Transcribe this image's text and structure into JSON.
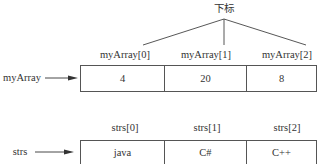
{
  "title": "下标",
  "myArray": {
    "name": "myArray",
    "indices": [
      "myArray[0]",
      "myArray[1]",
      "myArray[2]"
    ],
    "values": [
      "4",
      "20",
      "8"
    ]
  },
  "strs": {
    "name": "strs",
    "indices": [
      "strs[0]",
      "strs[1]",
      "strs[2]"
    ],
    "values": [
      "java",
      "C#",
      "C++"
    ]
  }
}
